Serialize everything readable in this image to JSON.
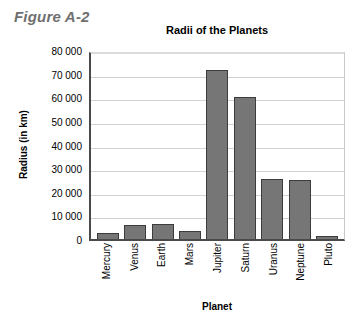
{
  "figure": {
    "label": "Figure A-2"
  },
  "axis_titles": {
    "y": "Radius (in km)",
    "x": "Planet"
  },
  "colors": {
    "bar_fill": "#767676",
    "bar_stroke": "#3c3c3c",
    "gridline": "#d2d2d2",
    "axis": "#4a4a4a",
    "figure_label": "#6f6f6f"
  },
  "chart_data": {
    "type": "bar",
    "title": "Radii of the Planets",
    "xlabel": "Planet",
    "ylabel": "Radius (in km)",
    "categories": [
      "Mercury",
      "Venus",
      "Earth",
      "Mars",
      "Jupiter",
      "Saturn",
      "Uranus",
      "Neptune",
      "Pluto"
    ],
    "values": [
      2440,
      6050,
      6400,
      3400,
      71500,
      60300,
      25600,
      24800,
      1150
    ],
    "ylim": [
      0,
      80000
    ],
    "ytick_step": 10000,
    "ytick_labels": [
      "0",
      "10 000",
      "20 000",
      "30 000",
      "40 000",
      "50 000",
      "60 000",
      "70 000",
      "80 000"
    ],
    "ytick_values": [
      0,
      10000,
      20000,
      30000,
      40000,
      50000,
      60000,
      70000,
      80000
    ],
    "grid": true,
    "legend": false
  }
}
